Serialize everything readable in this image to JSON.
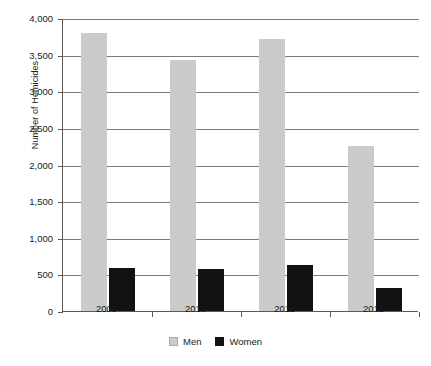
{
  "chart_data": {
    "type": "bar",
    "title": "",
    "xlabel": "",
    "ylabel": "Number of Homicides",
    "categories": [
      "2009",
      "2010",
      "2011",
      "2012"
    ],
    "series": [
      {
        "name": "Men",
        "color": "#cbcbc9",
        "values": [
          3790,
          3430,
          3720,
          2250
        ]
      },
      {
        "name": "Women",
        "color": "#121212",
        "values": [
          590,
          570,
          625,
          315
        ]
      }
    ],
    "ylim": [
      0,
      4000
    ],
    "yticks": [
      0,
      500,
      1000,
      1500,
      2000,
      2500,
      3000,
      3500,
      4000
    ],
    "ytick_labels": [
      "0",
      "500",
      "1,000",
      "1,500",
      "2,000",
      "2,500",
      "3,000",
      "3,500",
      "4,000"
    ],
    "grid": true,
    "legend_position": "bottom-center",
    "legend": [
      "Men",
      "Women"
    ]
  }
}
